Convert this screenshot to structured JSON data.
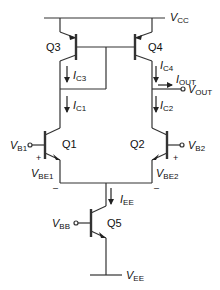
{
  "diagram": {
    "supplies": {
      "vcc": {
        "sym": "V",
        "sub": "CC"
      },
      "vee": {
        "sym": "V",
        "sub": "EE"
      }
    },
    "transistors": {
      "q1": "Q1",
      "q2": "Q2",
      "q3": "Q3",
      "q4": "Q4",
      "q5": "Q5"
    },
    "currents": {
      "ic3": {
        "sym": "I",
        "sub": "C3"
      },
      "ic4": {
        "sym": "I",
        "sub": "C4"
      },
      "ic1": {
        "sym": "I",
        "sub": "C1"
      },
      "ic2": {
        "sym": "I",
        "sub": "C2"
      },
      "iout": {
        "sym": "I",
        "sub": "OUT"
      },
      "iee": {
        "sym": "I",
        "sub": "EE"
      }
    },
    "voltages": {
      "vb1": {
        "sym": "V",
        "sub": "B1"
      },
      "vb2": {
        "sym": "V",
        "sub": "B2"
      },
      "vbb": {
        "sym": "V",
        "sub": "BB"
      },
      "vout": {
        "sym": "V",
        "sub": "OUT"
      },
      "vbe1": {
        "sym": "V",
        "sub": "BE1"
      },
      "vbe2": {
        "sym": "V",
        "sub": "BE2"
      }
    },
    "polarity": {
      "plus": "+",
      "minus": "–"
    },
    "line_color": "#333333"
  }
}
